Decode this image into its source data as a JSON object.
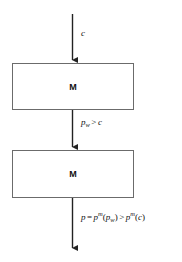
{
  "diagram": {
    "type": "flowchart",
    "orientation": "vertical",
    "background_color": "#ffffff",
    "line_color": "#222222",
    "box_border_color": "#6b6b6b",
    "text_color": "#111111",
    "nodes": [
      {
        "id": "box-1",
        "label": "M",
        "shape": "rectangle"
      },
      {
        "id": "box-2",
        "label": "M",
        "shape": "rectangle"
      }
    ],
    "edges": [
      {
        "id": "edge-in",
        "from": "input",
        "to": "box-1",
        "label_plain": "c",
        "label_parts": {
          "base": "c"
        }
      },
      {
        "id": "edge-mid",
        "from": "box-1",
        "to": "box-2",
        "label_plain": "p_w > c",
        "label_parts": {
          "lhs_base": "p",
          "lhs_sub": "w",
          "operator": ">",
          "rhs_base": "c"
        }
      },
      {
        "id": "edge-out",
        "from": "box-2",
        "to": "output",
        "label_plain": "p = p^m(p_w) > p^m(c)",
        "label_parts": {
          "result_base": "p",
          "equals": "=",
          "fn1_base": "p",
          "fn1_sup": "m",
          "open1": "(",
          "arg1_base": "p",
          "arg1_sub": "w",
          "close1": ")",
          "operator": ">",
          "fn2_base": "p",
          "fn2_sup": "m",
          "open2": "(",
          "arg2_base": "c",
          "close2": ")"
        }
      }
    ]
  }
}
